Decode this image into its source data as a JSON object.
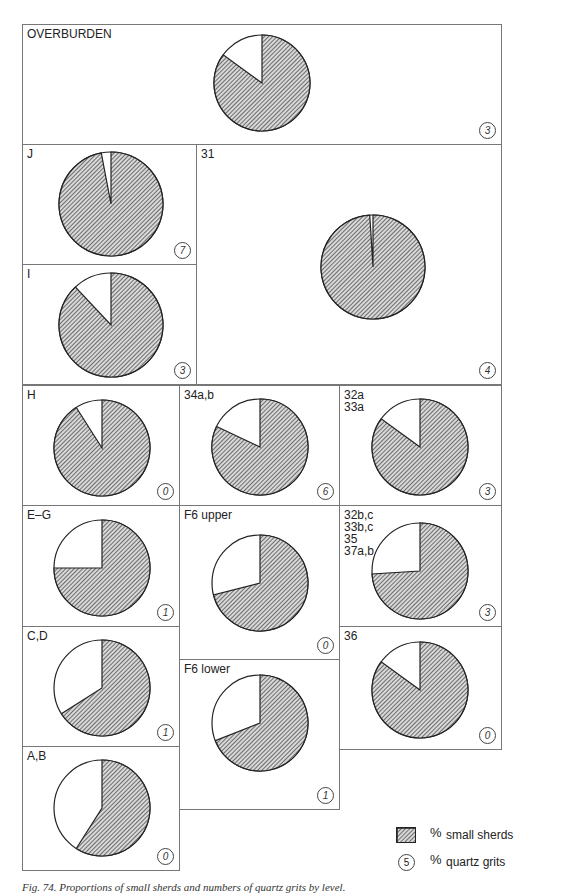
{
  "chart_data": {
    "type": "pie",
    "title": "Proportions of small sherds and numbers of quartz grits by level",
    "legend": {
      "hatched": "% small sherds",
      "circle_number": "% quartz grits",
      "circle_example": "5"
    },
    "colors": {
      "small_sherds": "#9a9a9a",
      "other": "#ffffff",
      "outline": "#222222"
    },
    "panels": [
      {
        "label": "OVERBURDEN",
        "small_sherds_pct": 85,
        "other_pct": 15,
        "quartz_grits": "3"
      },
      {
        "label": "J",
        "small_sherds_pct": 97,
        "other_pct": 3,
        "quartz_grits": "7"
      },
      {
        "label": "31",
        "small_sherds_pct": 99,
        "other_pct": 1,
        "quartz_grits": "4"
      },
      {
        "label": "I",
        "small_sherds_pct": 88,
        "other_pct": 12,
        "quartz_grits": "3"
      },
      {
        "label": "H",
        "small_sherds_pct": 91,
        "other_pct": 9,
        "quartz_grits": "0"
      },
      {
        "label": "34a,b",
        "small_sherds_pct": 82,
        "other_pct": 18,
        "quartz_grits": "6"
      },
      {
        "label": "32a\n33a",
        "small_sherds_pct": 85,
        "other_pct": 15,
        "quartz_grits": "3"
      },
      {
        "label": "E–G",
        "small_sherds_pct": 75,
        "other_pct": 25,
        "quartz_grits": "1"
      },
      {
        "label": "F6 upper",
        "small_sherds_pct": 71,
        "other_pct": 29,
        "quartz_grits": "0"
      },
      {
        "label": "32b,c\n33b,c\n35\n37a,b",
        "small_sherds_pct": 74,
        "other_pct": 26,
        "quartz_grits": "3"
      },
      {
        "label": "C,D",
        "small_sherds_pct": 66,
        "other_pct": 34,
        "quartz_grits": "1"
      },
      {
        "label": "F6 lower",
        "small_sherds_pct": 69,
        "other_pct": 31,
        "quartz_grits": "1"
      },
      {
        "label": "36",
        "small_sherds_pct": 85,
        "other_pct": 15,
        "quartz_grits": "0"
      },
      {
        "label": "A,B",
        "small_sherds_pct": 59,
        "other_pct": 41,
        "quartz_grits": "0"
      }
    ]
  },
  "legend": {
    "hatched_label": "small sherds",
    "circle_label": "quartz grits",
    "circle_example": "5",
    "percent_sign": "%"
  },
  "caption": "Fig. 74. Proportions of small sherds and numbers of quartz grits by level."
}
